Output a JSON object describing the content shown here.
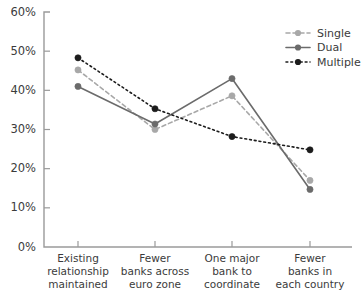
{
  "chart_data": {
    "type": "line",
    "title": "",
    "subtitle": "",
    "xlabel": "",
    "ylabel": "",
    "categories": [
      "Existing relationship maintained",
      "Fewer banks across euro zone",
      "One major bank to coordinate",
      "Fewer banks in each country"
    ],
    "category_lines": [
      [
        "Existing",
        "relationship",
        "maintained"
      ],
      [
        "Fewer",
        "banks across",
        "euro zone"
      ],
      [
        "One major",
        "bank to",
        "coordinate"
      ],
      [
        "Fewer",
        "banks in",
        "each country"
      ]
    ],
    "series": [
      {
        "name": "Single",
        "values": [
          45.2,
          30.0,
          38.6,
          17.0
        ],
        "color": "#a8a8a8",
        "dash": "4,3",
        "marker": "circle"
      },
      {
        "name": "Dual",
        "values": [
          41.0,
          31.4,
          43.0,
          14.7
        ],
        "color": "#6b6b6b",
        "dash": "none",
        "marker": "circle"
      },
      {
        "name": "Multiple",
        "values": [
          48.3,
          35.3,
          28.2,
          24.8
        ],
        "color": "#1c1c1c",
        "dash": "1.8,3",
        "marker": "circle"
      }
    ],
    "ylim": [
      0,
      60
    ],
    "ytick_values": [
      0,
      10,
      20,
      30,
      40,
      50,
      60
    ],
    "ytick_labels": [
      "0%",
      "10%",
      "20%",
      "30%",
      "40%",
      "50%",
      "60%"
    ],
    "grid": false,
    "legend_position": "top-right",
    "legend_entries": [
      "Single",
      "Dual",
      "Multiple"
    ]
  },
  "axes": {
    "y_axis_name": "percentage-axis",
    "x_axis_name": "option-axis"
  }
}
